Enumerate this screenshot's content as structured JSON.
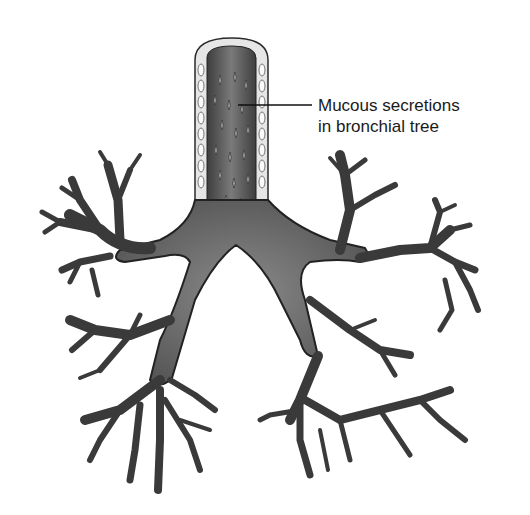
{
  "figure": {
    "colors": {
      "background": "#ffffff",
      "airway_fill": "#6e6e6e",
      "airway_dark": "#3a3a3a",
      "wall_light": "#d8d8d8",
      "outline": "#2a2a2a"
    }
  },
  "annotation": {
    "line1": "Mucous secretions",
    "line2": "in bronchial tree"
  }
}
